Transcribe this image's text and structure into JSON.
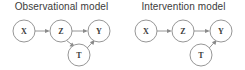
{
  "figure": {
    "width": 245,
    "height": 70,
    "background_color": "#ffffff",
    "node_stroke_color": "#8a8a8a",
    "node_fill_color": "#ffffff",
    "edge_color": "#8a8a8a",
    "text_color": "#3b3b3b"
  },
  "panels": [
    {
      "id": "observational",
      "title": "Observational model",
      "nodes": [
        {
          "id": "X",
          "label": "X",
          "cx": 24,
          "cy": 31,
          "r": 11
        },
        {
          "id": "Z",
          "label": "Z",
          "cx": 61,
          "cy": 31,
          "r": 11
        },
        {
          "id": "Y",
          "label": "Y",
          "cx": 99,
          "cy": 31,
          "r": 11
        },
        {
          "id": "T",
          "label": "T",
          "cx": 79,
          "cy": 55,
          "r": 11
        }
      ],
      "edges": [
        {
          "from": "X",
          "to": "Z",
          "directed": true
        },
        {
          "from": "Z",
          "to": "Y",
          "directed": true
        },
        {
          "from": "Z",
          "to": "T",
          "directed": true
        },
        {
          "from": "T",
          "to": "Y",
          "directed": true
        }
      ]
    },
    {
      "id": "intervention",
      "title": "Intervention model",
      "nodes": [
        {
          "id": "X",
          "label": "X",
          "cx": 24,
          "cy": 31,
          "r": 11
        },
        {
          "id": "Z",
          "label": "Z",
          "cx": 61,
          "cy": 31,
          "r": 11
        },
        {
          "id": "Y",
          "label": "Y",
          "cx": 99,
          "cy": 31,
          "r": 11
        },
        {
          "id": "T",
          "label": "T",
          "cx": 79,
          "cy": 55,
          "r": 11
        }
      ],
      "edges": [
        {
          "from": "X",
          "to": "Z",
          "directed": true
        },
        {
          "from": "Z",
          "to": "Y",
          "directed": true
        },
        {
          "from": "T",
          "to": "Y",
          "directed": true
        }
      ]
    }
  ]
}
